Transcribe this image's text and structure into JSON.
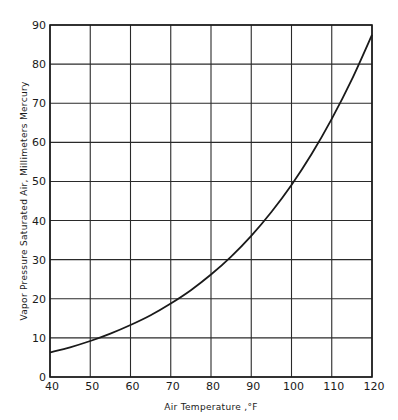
{
  "chart_data": {
    "type": "line",
    "title": "",
    "xlabel": "Air Temperature ,°F",
    "ylabel": "Vapor Pressure Saturated Air, Millimeters Mercury",
    "xlim": [
      40,
      120
    ],
    "ylim": [
      0,
      90
    ],
    "grid": true,
    "legend": null,
    "x_ticks": [
      40,
      50,
      60,
      70,
      80,
      90,
      100,
      110,
      120
    ],
    "y_ticks": [
      0,
      10,
      20,
      30,
      40,
      50,
      60,
      70,
      80,
      90
    ],
    "series": [
      {
        "name": "Saturated vapor pressure",
        "x": [
          40,
          45,
          50,
          55,
          60,
          65,
          70,
          75,
          80,
          85,
          90,
          95,
          100,
          105,
          110,
          115,
          120
        ],
        "values": [
          6.3,
          7.6,
          9.2,
          11.1,
          13.3,
          15.8,
          18.8,
          22.2,
          26.2,
          30.8,
          36.1,
          42.2,
          49.1,
          57.0,
          66.0,
          76.1,
          87.5
        ]
      }
    ]
  },
  "colors": {
    "line": "#1a1a1a",
    "grid": "#2a2a2a",
    "background": "#ffffff"
  }
}
